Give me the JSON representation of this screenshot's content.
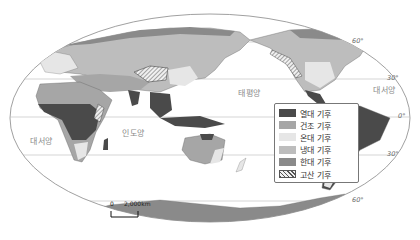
{
  "oceans": [
    {
      "name": "대서양",
      "position": "left"
    },
    {
      "name": "인도양",
      "position": "center-left"
    },
    {
      "name": "태평양",
      "position": "center-right"
    },
    {
      "name": "대서양",
      "position": "right"
    }
  ],
  "latitude_labels": [
    "60°",
    "30°",
    "0°",
    "30°",
    "60°"
  ],
  "legend": {
    "items": [
      {
        "label": "열대 기후",
        "color": "#4a4a4a"
      },
      {
        "label": "건조 기후",
        "color": "#a6a6a6"
      },
      {
        "label": "온대 기후",
        "color": "#e6e6e6"
      },
      {
        "label": "냉대 기후",
        "color": "#bdbdbd"
      },
      {
        "label": "한대 기후",
        "color": "#8a8a8a"
      },
      {
        "label": "고산 기후",
        "color": "hatched"
      }
    ]
  },
  "scale_bar": {
    "start": "0",
    "end": "2,000km"
  }
}
